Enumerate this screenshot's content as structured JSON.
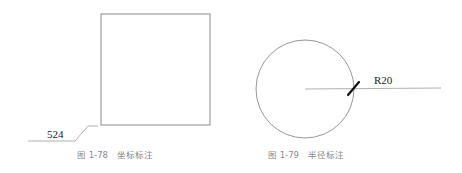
{
  "figures": [
    {
      "id": "fig-1-78",
      "caption": "图 1-78　坐标标注",
      "shape": "square",
      "dimension_text": "524",
      "dimension_type": "ordinate"
    },
    {
      "id": "fig-1-79",
      "caption": "图 1-79　半径标注",
      "shape": "circle",
      "dimension_text": "R20",
      "dimension_type": "radius"
    }
  ],
  "colors": {
    "outline": "#8a8a8a",
    "leader": "#9a9a9a",
    "tick": "#111111",
    "text": "#222222",
    "caption": "#888888",
    "background": "#ffffff"
  }
}
